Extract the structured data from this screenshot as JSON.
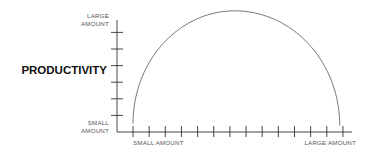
{
  "chart_data": {
    "type": "line",
    "title": "",
    "ylabel": "PRODUCTIVITY",
    "xlabel": "",
    "y_axis": {
      "top_label": [
        "LARGE",
        "AMOUNT"
      ],
      "bottom_label": [
        "SMALL",
        "AMOUNT"
      ],
      "tick_count": 6,
      "range": [
        0,
        7
      ]
    },
    "x_axis": {
      "left_label": "SMALL AMOUNT",
      "right_label": "LARGE AMOUNT",
      "tick_count": 14,
      "range": [
        0,
        14
      ]
    },
    "grid": false,
    "legend": "none",
    "series": [
      {
        "name": "productivity-curve",
        "shape": "inverted-u",
        "description": "Productivity rises from small to a peak at the midpoint and falls back to small",
        "x": [
          1,
          7.3,
          13.8
        ],
        "y": [
          0.5,
          7.3,
          0.4
        ]
      }
    ]
  }
}
